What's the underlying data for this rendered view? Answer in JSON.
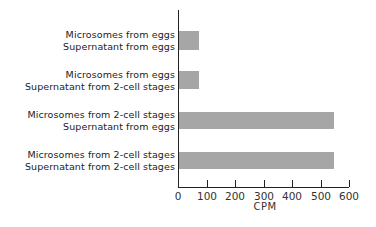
{
  "chart_data": {
    "type": "bar",
    "orientation": "horizontal",
    "title": "",
    "xlabel": "CPM",
    "ylabel": "",
    "xlim": [
      0,
      600
    ],
    "xticks": [
      "0",
      "100",
      "200",
      "300",
      "400",
      "500",
      "600"
    ],
    "grid": false,
    "categories": [
      "Microsomes from eggs / Supernatant from eggs",
      "Microsomes from eggs / Supernatant from 2-cell stages",
      "Microsomes from 2-cell stages / Supernatant from eggs",
      "Microsomes from 2-cell stages / Supernatant from 2-cell stages"
    ],
    "values": [
      70,
      70,
      545,
      545
    ],
    "bar_color": "#a6a6a6"
  },
  "labels": [
    {
      "line1": "Microsomes  from  eggs",
      "line2": "Supernatant  from  eggs"
    },
    {
      "line1": "Microsomes  from  eggs",
      "line2": "Supernatant  from  2-cell  stages"
    },
    {
      "line1": "Microsomes  from  2-cell stages",
      "line2": "Supernatant  from  eggs"
    },
    {
      "line1": "Microsomes  from  2-cell  stages",
      "line2": "Supernatant  from  2-cell  stages"
    }
  ]
}
